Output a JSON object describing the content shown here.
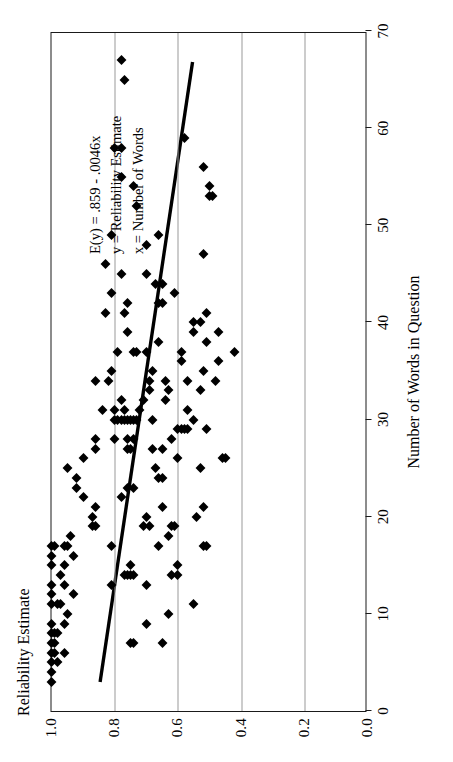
{
  "chart_data": {
    "type": "scatter",
    "title": "",
    "xlabel": "Number of Words in Question",
    "ylabel": "Reliability Estimate",
    "xlim": [
      0,
      70
    ],
    "ylim": [
      0.0,
      1.0
    ],
    "xticks": [
      "0",
      "10",
      "20",
      "30",
      "40",
      "50",
      "60",
      "70"
    ],
    "xtick_values": [
      0,
      10,
      20,
      30,
      40,
      50,
      60,
      70
    ],
    "yticks": [
      "1.0",
      "0.8",
      "0.6",
      "0.4",
      "0.2",
      "0.0"
    ],
    "ytick_values": [
      1.0,
      0.8,
      0.6,
      0.4,
      0.2,
      0.0
    ],
    "grid": "horizontal-only",
    "legend": "none",
    "marker": "filled-diamond",
    "marker_color": "#000000",
    "annotations": [
      "E(y) = .859 - .0046x",
      "y = Reliability Estimate",
      "x = Number of Words"
    ],
    "fit_line": {
      "intercept": 0.859,
      "slope": -0.0046,
      "x_start": 3,
      "x_end": 67,
      "color": "#000000",
      "width": 3.4
    },
    "points": [
      [
        3,
        1.0
      ],
      [
        4,
        1.0
      ],
      [
        5,
        0.98
      ],
      [
        5,
        1.0
      ],
      [
        6,
        0.96
      ],
      [
        6,
        1.0
      ],
      [
        6,
        0.99
      ],
      [
        7,
        1.0
      ],
      [
        7,
        0.99
      ],
      [
        7,
        0.75
      ],
      [
        7,
        0.74
      ],
      [
        7,
        0.65
      ],
      [
        8,
        1.0
      ],
      [
        8,
        0.99
      ],
      [
        8,
        0.98
      ],
      [
        9,
        1.0
      ],
      [
        9,
        0.96
      ],
      [
        9,
        0.7
      ],
      [
        10,
        0.95
      ],
      [
        10,
        0.63
      ],
      [
        11,
        1.0
      ],
      [
        11,
        0.98
      ],
      [
        11,
        0.97
      ],
      [
        11,
        0.55
      ],
      [
        12,
        1.0
      ],
      [
        12,
        0.93
      ],
      [
        13,
        1.0
      ],
      [
        13,
        0.96
      ],
      [
        13,
        0.81
      ],
      [
        13,
        0.7
      ],
      [
        14,
        0.97
      ],
      [
        14,
        0.77
      ],
      [
        14,
        0.76
      ],
      [
        14,
        0.75
      ],
      [
        14,
        0.74
      ],
      [
        14,
        0.62
      ],
      [
        14,
        0.6
      ],
      [
        15,
        1.0
      ],
      [
        15,
        0.96
      ],
      [
        15,
        0.75
      ],
      [
        15,
        0.6
      ],
      [
        16,
        1.0
      ],
      [
        16,
        0.93
      ],
      [
        17,
        1.0
      ],
      [
        17,
        0.99
      ],
      [
        17,
        0.96
      ],
      [
        17,
        0.95
      ],
      [
        17,
        0.81
      ],
      [
        17,
        0.66
      ],
      [
        17,
        0.52
      ],
      [
        17,
        0.51
      ],
      [
        18,
        0.94
      ],
      [
        18,
        0.63
      ],
      [
        19,
        0.87
      ],
      [
        19,
        0.86
      ],
      [
        19,
        0.71
      ],
      [
        19,
        0.69
      ],
      [
        19,
        0.62
      ],
      [
        19,
        0.61
      ],
      [
        20,
        0.87
      ],
      [
        20,
        0.7
      ],
      [
        20,
        0.54
      ],
      [
        21,
        0.86
      ],
      [
        21,
        0.65
      ],
      [
        21,
        0.52
      ],
      [
        22,
        0.9
      ],
      [
        22,
        0.78
      ],
      [
        23,
        0.92
      ],
      [
        23,
        0.76
      ],
      [
        23,
        0.74
      ],
      [
        24,
        0.92
      ],
      [
        24,
        0.66
      ],
      [
        24,
        0.65
      ],
      [
        25,
        0.95
      ],
      [
        25,
        0.67
      ],
      [
        25,
        0.53
      ],
      [
        26,
        0.9
      ],
      [
        26,
        0.6
      ],
      [
        26,
        0.46
      ],
      [
        26,
        0.45
      ],
      [
        27,
        0.86
      ],
      [
        27,
        0.76
      ],
      [
        27,
        0.75
      ],
      [
        27,
        0.68
      ],
      [
        27,
        0.65
      ],
      [
        28,
        0.86
      ],
      [
        28,
        0.8
      ],
      [
        28,
        0.76
      ],
      [
        28,
        0.74
      ],
      [
        28,
        0.62
      ],
      [
        29,
        0.6
      ],
      [
        29,
        0.59
      ],
      [
        29,
        0.58
      ],
      [
        29,
        0.57
      ],
      [
        29,
        0.51
      ],
      [
        30,
        0.8
      ],
      [
        30,
        0.79
      ],
      [
        30,
        0.78
      ],
      [
        30,
        0.77
      ],
      [
        30,
        0.76
      ],
      [
        30,
        0.75
      ],
      [
        30,
        0.74
      ],
      [
        30,
        0.73
      ],
      [
        30,
        0.68
      ],
      [
        30,
        0.55
      ],
      [
        31,
        0.84
      ],
      [
        31,
        0.8
      ],
      [
        31,
        0.77
      ],
      [
        31,
        0.72
      ],
      [
        31,
        0.57
      ],
      [
        32,
        0.78
      ],
      [
        32,
        0.71
      ],
      [
        32,
        0.64
      ],
      [
        33,
        0.69
      ],
      [
        33,
        0.63
      ],
      [
        33,
        0.53
      ],
      [
        34,
        0.86
      ],
      [
        34,
        0.82
      ],
      [
        34,
        0.69
      ],
      [
        34,
        0.64
      ],
      [
        34,
        0.57
      ],
      [
        34,
        0.48
      ],
      [
        35,
        0.81
      ],
      [
        35,
        0.68
      ],
      [
        35,
        0.52
      ],
      [
        36,
        0.59
      ],
      [
        36,
        0.47
      ],
      [
        37,
        0.79
      ],
      [
        37,
        0.74
      ],
      [
        37,
        0.73
      ],
      [
        37,
        0.7
      ],
      [
        37,
        0.59
      ],
      [
        37,
        0.42
      ],
      [
        38,
        0.66
      ],
      [
        38,
        0.51
      ],
      [
        39,
        0.76
      ],
      [
        39,
        0.55
      ],
      [
        39,
        0.47
      ],
      [
        40,
        0.55
      ],
      [
        40,
        0.53
      ],
      [
        41,
        0.83
      ],
      [
        41,
        0.77
      ],
      [
        41,
        0.51
      ],
      [
        42,
        0.76
      ],
      [
        42,
        0.66
      ],
      [
        42,
        0.65
      ],
      [
        43,
        0.81
      ],
      [
        43,
        0.61
      ],
      [
        44,
        0.67
      ],
      [
        44,
        0.65
      ],
      [
        45,
        0.78
      ],
      [
        45,
        0.7
      ],
      [
        46,
        0.83
      ],
      [
        47,
        0.52
      ],
      [
        48,
        0.7
      ],
      [
        49,
        0.81
      ],
      [
        49,
        0.66
      ],
      [
        52,
        0.73
      ],
      [
        53,
        0.5
      ],
      [
        53,
        0.49
      ],
      [
        54,
        0.5
      ],
      [
        54,
        0.74
      ],
      [
        55,
        0.78
      ],
      [
        56,
        0.52
      ],
      [
        58,
        0.8
      ],
      [
        58,
        0.78
      ],
      [
        59,
        0.58
      ],
      [
        65,
        0.77
      ],
      [
        67,
        0.78
      ]
    ]
  }
}
